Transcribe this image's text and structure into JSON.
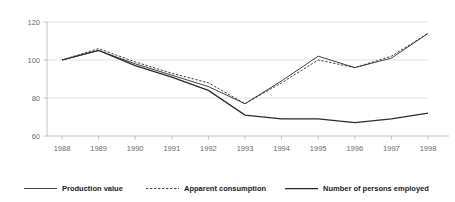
{
  "chart_data": {
    "type": "line",
    "title": "",
    "subtitle": "",
    "xlabel": "",
    "ylabel": "",
    "x": [
      1988,
      1989,
      1990,
      1991,
      1992,
      1993,
      1994,
      1995,
      1996,
      1997,
      1998
    ],
    "categories": [
      "1988",
      "1989",
      "1990",
      "1991",
      "1992",
      "1993",
      "1994",
      "1995",
      "1996",
      "1997",
      "1998"
    ],
    "series": [
      {
        "name": "Production value",
        "style": "solid",
        "color": "#2b2b2b",
        "values": [
          100,
          105,
          98,
          92,
          86,
          77,
          89,
          102,
          96,
          101,
          114
        ]
      },
      {
        "name": "Apparent consumption",
        "style": "dashed",
        "color": "#2b2b2b",
        "values": [
          100,
          106,
          99,
          93,
          88,
          77,
          88,
          100,
          96,
          102,
          114
        ]
      },
      {
        "name": "Number of persons employed",
        "style": "solid-thick",
        "color": "#2b2b2b",
        "values": [
          100,
          105,
          97,
          91,
          84,
          71,
          69,
          69,
          67,
          69,
          72
        ]
      }
    ],
    "ylim": [
      60,
      120
    ],
    "yticks": [
      60,
      80,
      100,
      120
    ],
    "ytick_labels": [
      "60",
      "80",
      "100",
      "120"
    ],
    "xlim": [
      1988,
      1998
    ],
    "grid": true,
    "grid_axis": "y",
    "legend_position": "bottom",
    "legend": [
      {
        "label": "Production value",
        "style": "solid"
      },
      {
        "label": "Apparent consumption",
        "style": "dashed"
      },
      {
        "label": "Number of persons employed",
        "style": "solid-thick"
      }
    ]
  }
}
